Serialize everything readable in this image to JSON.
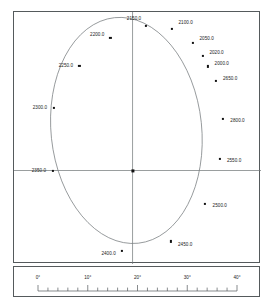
{
  "figure": {
    "background_color": "#ffffff",
    "frame_color": "#555a5c",
    "axis_color": "#6f7476",
    "curve_color": "#7a7f81",
    "marker_color": "#111111",
    "label_color": "#1a1a1a"
  },
  "chart_data": {
    "type": "scatter",
    "title": "",
    "subtitle": "",
    "xlabel": "",
    "ylabel": "",
    "grid": false,
    "legend": null,
    "axis_lines": {
      "vertical_x_pct": 48.0,
      "horizontal_y_pct": 62.9
    },
    "center_point": {
      "x_pct": 48.0,
      "y_pct": 62.9
    },
    "ellipse": {
      "center_x_pct": 45.5,
      "center_y_pct": 47.0,
      "radius_x_pct": 30.5,
      "radius_y_pct": 45.0,
      "rotation_deg": -6
    },
    "points": [
      {
        "label": "2150.0",
        "x_pct": 53.5,
        "y_pct": 5.4,
        "label_side": "left",
        "label_dx": -2.0,
        "label_dy": -3.2
      },
      {
        "label": "2100.0",
        "x_pct": 64.0,
        "y_pct": 6.6,
        "label_side": "right",
        "label_dx": 2.6,
        "label_dy": -2.6
      },
      {
        "label": "2050.0",
        "x_pct": 72.5,
        "y_pct": 12.2,
        "label_side": "right",
        "label_dx": 2.6,
        "label_dy": -1.8
      },
      {
        "label": "2020.0",
        "x_pct": 76.5,
        "y_pct": 17.5,
        "label_side": "right",
        "label_dx": 2.6,
        "label_dy": -1.6
      },
      {
        "label": "2000.0",
        "x_pct": 78.6,
        "y_pct": 21.6,
        "label_side": "right",
        "label_dx": 2.6,
        "label_dy": -1.4
      },
      {
        "label": "2650.0",
        "x_pct": 81.8,
        "y_pct": 27.5,
        "label_side": "right",
        "label_dx": 2.8,
        "label_dy": -1.2
      },
      {
        "label": "2800.0",
        "x_pct": 84.6,
        "y_pct": 42.5,
        "label_side": "right",
        "label_dx": 3.0,
        "label_dy": 0.4
      },
      {
        "label": "2550.0",
        "x_pct": 83.2,
        "y_pct": 58.2,
        "label_side": "right",
        "label_dx": 3.0,
        "label_dy": 0.4
      },
      {
        "label": "2500.0",
        "x_pct": 77.4,
        "y_pct": 76.0,
        "label_side": "right",
        "label_dx": 3.0,
        "label_dy": 0.6
      },
      {
        "label": "2450.0",
        "x_pct": 63.6,
        "y_pct": 91.0,
        "label_side": "right",
        "label_dx": 2.8,
        "label_dy": 1.0
      },
      {
        "label": "2400.0",
        "x_pct": 43.8,
        "y_pct": 94.8,
        "label_side": "left",
        "label_dx": -2.6,
        "label_dy": 0.8
      },
      {
        "label": "2350.0",
        "x_pct": 15.6,
        "y_pct": 62.9,
        "label_side": "left",
        "label_dx": -2.6,
        "label_dy": -0.4
      },
      {
        "label": "2300.0",
        "x_pct": 16.0,
        "y_pct": 38.0,
        "label_side": "left",
        "label_dx": -2.6,
        "label_dy": -0.2
      },
      {
        "label": "2250.0",
        "x_pct": 26.5,
        "y_pct": 21.5,
        "label_side": "left",
        "label_dx": -2.6,
        "label_dy": -0.6
      },
      {
        "label": "2200.0",
        "x_pct": 39.0,
        "y_pct": 10.4,
        "label_side": "left",
        "label_dx": -2.4,
        "label_dy": -1.6
      }
    ],
    "scale_bar": {
      "units": "degrees",
      "min": 0,
      "max": 40,
      "major_tick_step": 10,
      "minor_tick_step": 2,
      "tick_labels": [
        "0°",
        "10°",
        "20°",
        "30°",
        "40°"
      ],
      "tick_values": [
        0,
        10,
        20,
        30,
        40
      ]
    }
  }
}
